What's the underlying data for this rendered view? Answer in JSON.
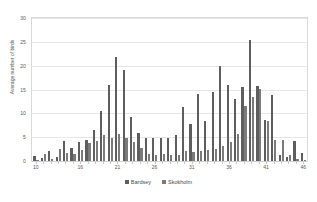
{
  "chart_data": {
    "type": "bar",
    "title": "",
    "subtitle": "",
    "xlabel": "",
    "ylabel": "Average number of birds",
    "ylim": [
      0,
      30
    ],
    "ytick_labels": [
      "30",
      "25",
      "20",
      "15",
      "10",
      "5",
      "0"
    ],
    "ytick_values": [
      30,
      25,
      20,
      15,
      10,
      5,
      0
    ],
    "grid": true,
    "legend_position": "bottom",
    "categories": [
      "10",
      "11",
      "12",
      "13",
      "14",
      "15",
      "16",
      "17",
      "18",
      "19",
      "20",
      "21",
      "22",
      "23",
      "24",
      "25",
      "26",
      "27",
      "28",
      "29",
      "30",
      "31",
      "32",
      "33",
      "34",
      "35",
      "36",
      "37",
      "38",
      "39",
      "40",
      "41",
      "42",
      "43",
      "44",
      "45",
      "46"
    ],
    "xtick_labels": [
      "10",
      "16",
      "21",
      "26",
      "31",
      "36",
      "41",
      "46"
    ],
    "xtick_values": [
      10,
      16,
      21,
      26,
      31,
      36,
      41,
      46
    ],
    "series": [
      {
        "name": "Bardsey",
        "color": "#5e5e5e",
        "values": [
          1.0,
          0.6,
          2.0,
          0.8,
          4.2,
          2.8,
          3.9,
          4.4,
          6.5,
          10.5,
          16.0,
          21.8,
          19.0,
          9.2,
          5.8,
          4.9,
          4.8,
          4.8,
          4.8,
          5.5,
          11.4,
          7.8,
          14.0,
          8.4,
          14.5,
          19.9,
          16.0,
          13.0,
          15.5,
          25.4,
          15.8,
          8.6,
          13.8,
          1.3,
          0.9,
          4.3,
          1.6
        ]
      },
      {
        "name": "Skokholm",
        "color": "#7b7b7b",
        "values": [
          0.2,
          1.4,
          0.5,
          2.6,
          1.6,
          1.5,
          2.4,
          3.7,
          4.1,
          5.5,
          4.8,
          5.7,
          4.9,
          4.0,
          2.7,
          1.4,
          1.3,
          1.4,
          1.2,
          1.3,
          2.0,
          1.9,
          2.2,
          2.3,
          2.5,
          3.2,
          4.0,
          5.6,
          11.6,
          13.4,
          15.2,
          8.4,
          4.4,
          4.4,
          1.2,
          0.4,
          0.3
        ]
      }
    ]
  },
  "legend": {
    "items": [
      {
        "label": "Bardsey",
        "color": "#5e5e5e"
      },
      {
        "label": "Skokholm",
        "color": "#7b7b7b"
      }
    ]
  }
}
